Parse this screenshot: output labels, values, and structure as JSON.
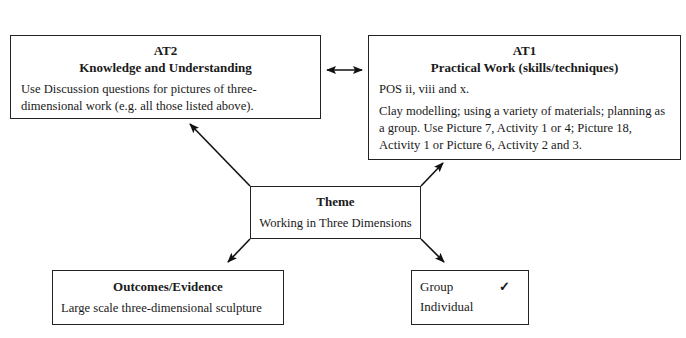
{
  "at2": {
    "heading": "AT2",
    "subheading": "Knowledge and Understanding",
    "lines": [
      "Use Discussion questions for pictures of three-",
      "dimensional work (e.g. all those listed above)."
    ]
  },
  "at1": {
    "heading": "AT1",
    "subheading": "Practical Work (skills/techniques)",
    "pos": "POS ii, viii and x.",
    "lines": [
      "Clay modelling; using a variety of materials; planning as",
      "a group. Use Picture 7, Activity 1 or 4; Picture 18,",
      "Activity 1 or Picture 6, Activity 2 and 3."
    ]
  },
  "theme": {
    "heading": "Theme",
    "text": "Working in Three Dimensions"
  },
  "outcomes": {
    "heading": "Outcomes/Evidence",
    "text": "Large scale three-dimensional sculpture"
  },
  "grouping": {
    "options": [
      {
        "label": "Group",
        "mark": "✓"
      },
      {
        "label": "Individual",
        "mark": ""
      }
    ]
  }
}
